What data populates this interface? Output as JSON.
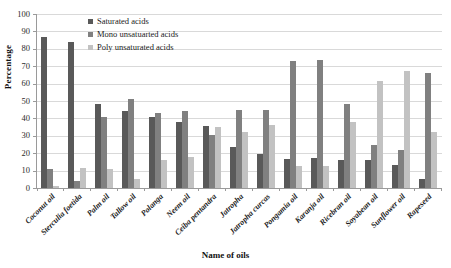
{
  "chart_data": {
    "type": "bar",
    "title": "",
    "xlabel": "Name of oils",
    "ylabel": "Percentage",
    "ylim": [
      0,
      100
    ],
    "yticks": [
      0,
      10,
      20,
      30,
      40,
      50,
      60,
      70,
      80,
      90,
      100
    ],
    "grid": true,
    "legend_position": "top-center",
    "categories": [
      "Coconut oil",
      "Sterculia foetida",
      "Palm oil",
      "Tallow oil",
      "Polanga",
      "Neem oil",
      "Ceiba pentandra",
      "Jatropha",
      "Jatropha curcas",
      "Pongamia oil",
      "Karanja oil",
      "Ricebran oil",
      "Soyabean oil",
      "Sunflower oil",
      "Rapeseed"
    ],
    "series": [
      {
        "name": "Saturated acids",
        "color": "#595959",
        "values": [
          87,
          84,
          48,
          44,
          41,
          38,
          35.5,
          23.5,
          19.5,
          16.5,
          17,
          16,
          16,
          13,
          5
        ]
      },
      {
        "name": "Mono unsatuarted acids",
        "color": "#808080",
        "values": [
          11,
          4,
          41,
          51,
          43,
          44,
          30.5,
          45,
          45,
          73,
          73.5,
          48.5,
          25,
          22,
          66
        ]
      },
      {
        "name": "Poly unsaturated acids",
        "color": "#c2c2c2",
        "values": [
          1,
          11.5,
          11,
          5,
          16,
          18,
          35,
          32,
          36,
          12.5,
          12.5,
          38,
          61.5,
          67.5,
          32
        ]
      }
    ]
  }
}
